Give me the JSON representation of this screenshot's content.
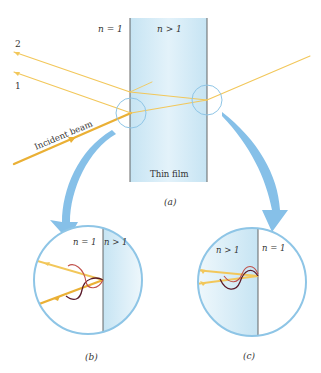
{
  "figure": {
    "panel_a": {
      "medium_left_label": "n = 1",
      "medium_right_label": "n > 1",
      "film_label": "Thin film",
      "incident_label": "Incident beam",
      "ray_labels": [
        "2",
        "1"
      ],
      "caption": "(a)"
    },
    "panel_b": {
      "left_label": "n = 1",
      "right_label": "n > 1",
      "caption": "(b)"
    },
    "panel_c": {
      "left_label": "n > 1",
      "right_label": "n = 1",
      "caption": "(c)"
    },
    "colors": {
      "film_blue": "#cfe8f4",
      "circle_blue": "#8ec5e6",
      "arrow_blue": "#86c0e8",
      "ray_yellow": "#f2c75a",
      "incident_orange": "#eab035",
      "wave_dark": "#5a1a2a",
      "wave_red": "#c0504a",
      "boundary": "#555555"
    }
  }
}
